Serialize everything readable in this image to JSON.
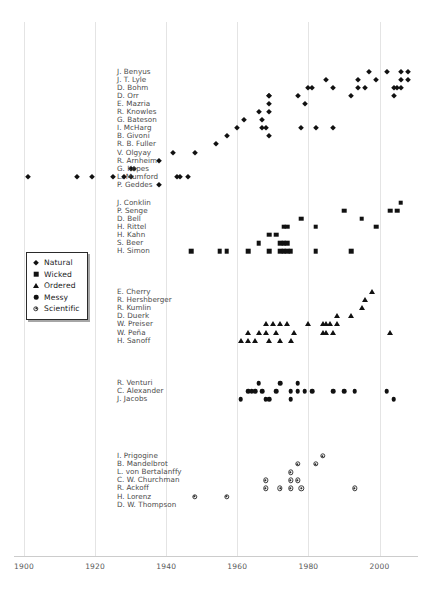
{
  "chart_data": {
    "type": "scatter",
    "title": "",
    "xlabel": "",
    "ylabel": "",
    "grid": true,
    "xlim": [
      1896,
      2012
    ],
    "xticks": [
      1900,
      1920,
      1940,
      1960,
      1980,
      2000
    ],
    "xtick_labels": [
      "1900",
      "1920",
      "1940",
      "1960",
      "1980",
      "2000"
    ],
    "legend_position": "left-middle",
    "legend": [
      {
        "label": "Natural",
        "marker": "diamond"
      },
      {
        "label": "Wicked",
        "marker": "square"
      },
      {
        "label": "Ordered",
        "marker": "triangle"
      },
      {
        "label": "Messy",
        "marker": "circle"
      },
      {
        "label": "Scientific",
        "marker": "circled-dot"
      }
    ],
    "series": [
      {
        "name": "Natural",
        "marker": "diamond",
        "rows": [
          {
            "label": "J. Benyus",
            "x": [
              1997,
              2002,
              2006,
              2008
            ]
          },
          {
            "label": "J. T. Lyle",
            "x": [
              1985,
              1994,
              1999,
              2006,
              2008
            ]
          },
          {
            "label": "D. Bohm",
            "x": [
              1980,
              1981,
              1987,
              1994,
              1996,
              2004,
              2005,
              2006
            ]
          },
          {
            "label": "D. Orr",
            "x": [
              1969,
              1977,
              1992,
              2004
            ]
          },
          {
            "label": "D. Orr",
            "x": [
              1969
            ]
          },
          {
            "label": "E. Mazria",
            "x": [
              1969,
              1979
            ]
          },
          {
            "label": "R. Knowles",
            "x": [
              1966,
              1969
            ]
          },
          {
            "label": "G. Bateson",
            "x": [
              1962,
              1967
            ]
          },
          {
            "label": "I. McHarg",
            "x": [
              1960,
              1967,
              1968,
              1978,
              1982,
              1987
            ]
          },
          {
            "label": "B. Givoni",
            "x": [
              1957,
              1969
            ]
          },
          {
            "label": "R. B. Fuller",
            "x": [
              1954
            ]
          },
          {
            "label": "V. Olgyay",
            "x": [
              1942,
              1948
            ]
          },
          {
            "label": "R. Arnheim",
            "x": [
              1938
            ]
          },
          {
            "label": "G. Kepes",
            "x": [
              1930,
              1931
            ]
          },
          {
            "label": "L. Mumford",
            "x": [
              1901,
              1915,
              1919,
              1925,
              1928,
              1930,
              1943,
              1944,
              1946
            ]
          },
          {
            "label": "P. Geddes",
            "x": [
              1938
            ]
          }
        ]
      },
      {
        "name": "Wicked",
        "marker": "square",
        "rows": [
          {
            "label": "J. Conklin",
            "x": [
              2006
            ]
          },
          {
            "label": "P. Senge",
            "x": [
              1990,
              2003,
              2005
            ]
          },
          {
            "label": "D. Bell",
            "x": [
              1978,
              1995
            ]
          },
          {
            "label": "H. Rittel",
            "x": [
              1973,
              1974,
              1982,
              1999
            ]
          },
          {
            "label": "H. Kahn",
            "x": [
              1969,
              1971
            ]
          },
          {
            "label": "S. Beer",
            "x": [
              1966,
              1972,
              1973,
              1974
            ]
          },
          {
            "label": "H. Simon",
            "x": [
              1947,
              1955,
              1957,
              1963,
              1969,
              1972,
              1973,
              1974,
              1975,
              1982,
              1992
            ]
          }
        ]
      },
      {
        "name": "Ordered",
        "marker": "triangle",
        "rows": [
          {
            "label": "E. Cherry",
            "x": [
              1998
            ]
          },
          {
            "label": "R. Hershberger",
            "x": [
              1996
            ]
          },
          {
            "label": "R. Kumlin",
            "x": [
              1995
            ]
          },
          {
            "label": "D. Duerk",
            "x": [
              1988,
              1992
            ]
          },
          {
            "label": "W. Preiser",
            "x": [
              1968,
              1970,
              1972,
              1974,
              1980,
              1984,
              1985,
              1986,
              1988
            ]
          },
          {
            "label": "W. Peña",
            "x": [
              1963,
              1966,
              1968,
              1971,
              1976,
              1984,
              1985,
              1987,
              2003
            ]
          },
          {
            "label": "H. Sanoff",
            "x": [
              1961,
              1963,
              1965,
              1969,
              1972,
              1975
            ]
          }
        ]
      },
      {
        "name": "Messy",
        "marker": "circle",
        "rows": [
          {
            "label": "R. Venturi",
            "x": [
              1966,
              1972,
              1977
            ]
          },
          {
            "label": "C. Alexander",
            "x": [
              1963,
              1964,
              1965,
              1967,
              1971,
              1975,
              1977,
              1979,
              1981,
              1987,
              1990,
              1993,
              2002
            ]
          },
          {
            "label": "J. Jacobs",
            "x": [
              1961,
              1968,
              1969,
              1975,
              2004
            ]
          }
        ]
      },
      {
        "name": "Scientific",
        "marker": "circled-dot",
        "rows": [
          {
            "label": "I. Prigogine",
            "x": [
              1984
            ]
          },
          {
            "label": "B. Mandelbrot",
            "x": [
              1977,
              1982
            ]
          },
          {
            "label": "L. von Bertalanffy",
            "x": [
              1975
            ]
          },
          {
            "label": "C. W. Churchman",
            "x": [
              1968,
              1975,
              1977
            ]
          },
          {
            "label": "R. Ackoff",
            "x": [
              1968,
              1972,
              1975,
              1978,
              1993
            ]
          },
          {
            "label": "H. Lorenz",
            "x": [
              1948,
              1957
            ]
          },
          {
            "label": "D. W. Thompson",
            "x": []
          }
        ]
      }
    ]
  },
  "axis": {
    "tick_1900": "1900",
    "tick_1920": "1920",
    "tick_1940": "1940",
    "tick_1960": "1960",
    "tick_1980": "1980",
    "tick_2000": "2000"
  },
  "groups": {
    "natural": {
      "name": "Natural",
      "labels": [
        "J. Benyus",
        "J. T. Lyle",
        "D. Bohm",
        "D. Orr",
        "E. Mazria",
        "R. Knowles",
        "G. Bateson",
        "I. McHarg",
        "B. Givoni",
        "R. B. Fuller",
        "V. Olgyay",
        "R. Arnheim",
        "G. Kepes",
        "L. Mumford",
        "P. Geddes"
      ]
    },
    "wicked": {
      "name": "Wicked",
      "labels": [
        "J. Conklin",
        "P. Senge",
        "D. Bell",
        "H. Rittel",
        "H. Kahn",
        "S. Beer",
        "H. Simon"
      ]
    },
    "ordered": {
      "name": "Ordered",
      "labels": [
        "E. Cherry",
        "R. Hershberger",
        "R. Kumlin",
        "D. Duerk",
        "W. Preiser",
        "W. Peña",
        "H. Sanoff"
      ]
    },
    "messy": {
      "name": "Messy",
      "labels": [
        "R. Venturi",
        "C. Alexander",
        "J. Jacobs"
      ]
    },
    "scientific": {
      "name": "Scientific",
      "labels": [
        "I. Prigogine",
        "B. Mandelbrot",
        "L. von Bertalanffy",
        "C. W. Churchman",
        "R. Ackoff",
        "H. Lorenz",
        "D. W. Thompson"
      ]
    }
  },
  "colors": {
    "marker": "#111111",
    "grid": "#e4e4e4",
    "axis": "#cccccc",
    "label_text": "#4a4a4a",
    "tick_text": "#585858",
    "legend_border": "#2a2a2a",
    "background": "#ffffff"
  }
}
